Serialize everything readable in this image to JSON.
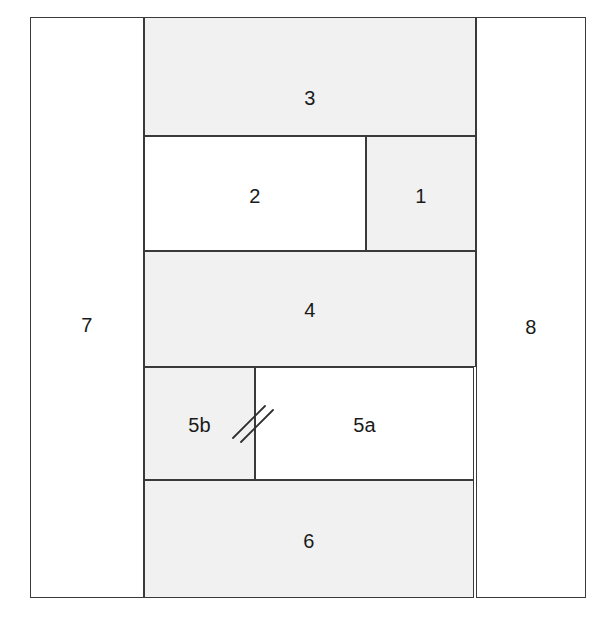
{
  "figure": {
    "type": "stratigraphic-column-block-diagram",
    "background_color": "#ffffff",
    "stroke_color": "#3a3a3a",
    "shaded_fill": "#f1f1f1",
    "plain_fill": "#ffffff",
    "label_color": "#1a1a1a"
  },
  "frame": {
    "name": "outer-frame",
    "x": 30,
    "y": 17,
    "width": 556,
    "height": 581
  },
  "units": [
    {
      "id": "unit-7",
      "label": "7",
      "fill": "plain",
      "x": 30,
      "y": 17,
      "width": 114,
      "height": 581,
      "label_x": 87,
      "label_y": 308
    },
    {
      "id": "unit-3",
      "label": "3",
      "fill": "shaded",
      "x": 144,
      "y": 17,
      "width": 332,
      "height": 119,
      "label_x": 310,
      "label_y": 81
    },
    {
      "id": "unit-2",
      "label": "2",
      "fill": "plain",
      "x": 144,
      "y": 136,
      "width": 222,
      "height": 115,
      "label_x": 255,
      "label_y": 196
    },
    {
      "id": "unit-1",
      "label": "1",
      "fill": "shaded",
      "x": 366,
      "y": 136,
      "width": 110,
      "height": 115,
      "label_x": 421,
      "label_y": 196
    },
    {
      "id": "unit-4",
      "label": "4",
      "fill": "shaded",
      "x": 144,
      "y": 251,
      "width": 332,
      "height": 116,
      "label_x": 310,
      "label_y": 310
    },
    {
      "id": "unit-5b",
      "label": "5b",
      "fill": "shaded",
      "x": 144,
      "y": 367,
      "width": 111,
      "height": 113,
      "label_x": 200,
      "label_y": 425
    },
    {
      "id": "unit-5a",
      "label": "5a",
      "fill": "plain",
      "x": 255,
      "y": 367,
      "width": 219,
      "height": 113,
      "label_x": 367,
      "label_y": 425
    },
    {
      "id": "unit-6",
      "label": "6",
      "fill": "shaded",
      "x": 144,
      "y": 480,
      "width": 330,
      "height": 118,
      "label_x": 310,
      "label_y": 541
    },
    {
      "id": "unit-8",
      "label": "8",
      "fill": "plain",
      "x": 476,
      "y": 17,
      "width": 110,
      "height": 581,
      "label_x": 529,
      "label_y": 310
    }
  ],
  "markings": [
    {
      "id": "correlation-ticks",
      "name": "double-slash-correlation-mark",
      "description": "pair of short parallel diagonal strokes crossing the 5b / 5a contact",
      "center_x": 255,
      "center_y": 424,
      "stroke_count": 2
    }
  ]
}
